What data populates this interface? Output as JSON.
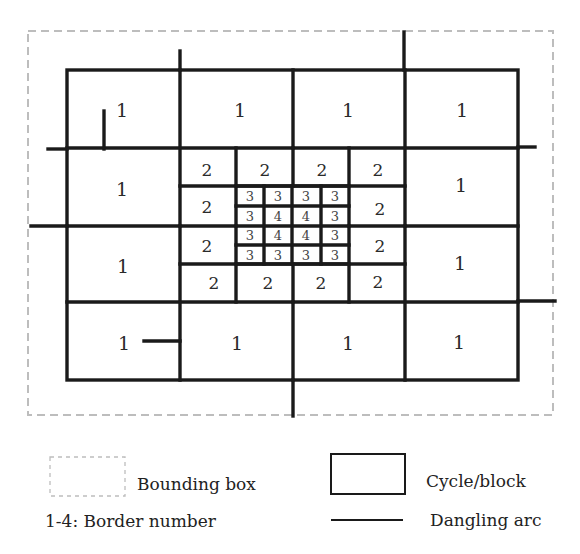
{
  "figure": {
    "title": "",
    "bounding_box": {
      "x": 28,
      "y": 31,
      "w": 525,
      "h": 384,
      "color": "#bdbdbd"
    },
    "outer_block": {
      "x": 67,
      "y": 70,
      "w": 451,
      "h": 310
    },
    "grid": {
      "main_vertical_x": [
        67,
        180,
        293,
        405,
        518
      ],
      "main_horizontal_y": [
        70,
        148,
        226,
        302,
        380
      ],
      "level2_horizontal_y": [
        186,
        264
      ],
      "level2_vertical_x": [
        236,
        349
      ],
      "level3_x": [
        236,
        264,
        292,
        321,
        349
      ],
      "level3_y": [
        186,
        206,
        226,
        245,
        264
      ]
    },
    "border_numbers": {
      "level1": [
        {
          "label": "1",
          "x": 122,
          "y": 110
        },
        {
          "label": "1",
          "x": 240,
          "y": 110
        },
        {
          "label": "1",
          "x": 348,
          "y": 110
        },
        {
          "label": "1",
          "x": 462,
          "y": 110
        },
        {
          "label": "1",
          "x": 122,
          "y": 189
        },
        {
          "label": "1",
          "x": 461,
          "y": 185
        },
        {
          "label": "1",
          "x": 123,
          "y": 266
        },
        {
          "label": "1",
          "x": 460,
          "y": 263
        },
        {
          "label": "1",
          "x": 124,
          "y": 343
        },
        {
          "label": "1",
          "x": 237,
          "y": 343
        },
        {
          "label": "1",
          "x": 348,
          "y": 343
        },
        {
          "label": "1",
          "x": 459,
          "y": 342
        }
      ],
      "level2": [
        {
          "label": "2",
          "x": 207,
          "y": 170
        },
        {
          "label": "2",
          "x": 265,
          "y": 170
        },
        {
          "label": "2",
          "x": 322,
          "y": 170
        },
        {
          "label": "2",
          "x": 378,
          "y": 170
        },
        {
          "label": "2",
          "x": 207,
          "y": 207
        },
        {
          "label": "2",
          "x": 380,
          "y": 209
        },
        {
          "label": "2",
          "x": 207,
          "y": 246
        },
        {
          "label": "2",
          "x": 380,
          "y": 246
        },
        {
          "label": "2",
          "x": 214,
          "y": 283
        },
        {
          "label": "2",
          "x": 268,
          "y": 283
        },
        {
          "label": "2",
          "x": 321,
          "y": 283
        },
        {
          "label": "2",
          "x": 378,
          "y": 282
        }
      ],
      "level3_matrix": [
        [
          "3",
          "3",
          "3",
          "3"
        ],
        [
          "3",
          "4",
          "4",
          "3"
        ],
        [
          "3",
          "4",
          "4",
          "3"
        ],
        [
          "3",
          "3",
          "3",
          "3"
        ]
      ]
    },
    "dangling_arcs": [
      {
        "x1": 180,
        "y1": 51,
        "x2": 180,
        "y2": 70
      },
      {
        "x1": 404,
        "y1": 32,
        "x2": 404,
        "y2": 70
      },
      {
        "x1": 48,
        "y1": 149,
        "x2": 67,
        "y2": 149
      },
      {
        "x1": 518,
        "y1": 147,
        "x2": 535,
        "y2": 147
      },
      {
        "x1": 104,
        "y1": 111,
        "x2": 104,
        "y2": 149
      },
      {
        "x1": 31,
        "y1": 226,
        "x2": 67,
        "y2": 226
      },
      {
        "x1": 518,
        "y1": 301,
        "x2": 555,
        "y2": 301
      },
      {
        "x1": 144,
        "y1": 341,
        "x2": 180,
        "y2": 341
      },
      {
        "x1": 293,
        "y1": 380,
        "x2": 293,
        "y2": 416
      }
    ]
  },
  "legend": {
    "bounding_box_label": "Bounding box",
    "cycle_block_label": "Cycle/block",
    "border_number_label": "1-4: Border number",
    "dangling_arc_label": "Dangling arc",
    "items": [
      {
        "symbol": "dashed-rectangle",
        "label": "Bounding box"
      },
      {
        "symbol": "solid-rectangle",
        "label": "Cycle/block"
      },
      {
        "symbol": "text",
        "label": "1-4: Border number"
      },
      {
        "symbol": "solid-line",
        "label": "Dangling arc"
      }
    ]
  }
}
